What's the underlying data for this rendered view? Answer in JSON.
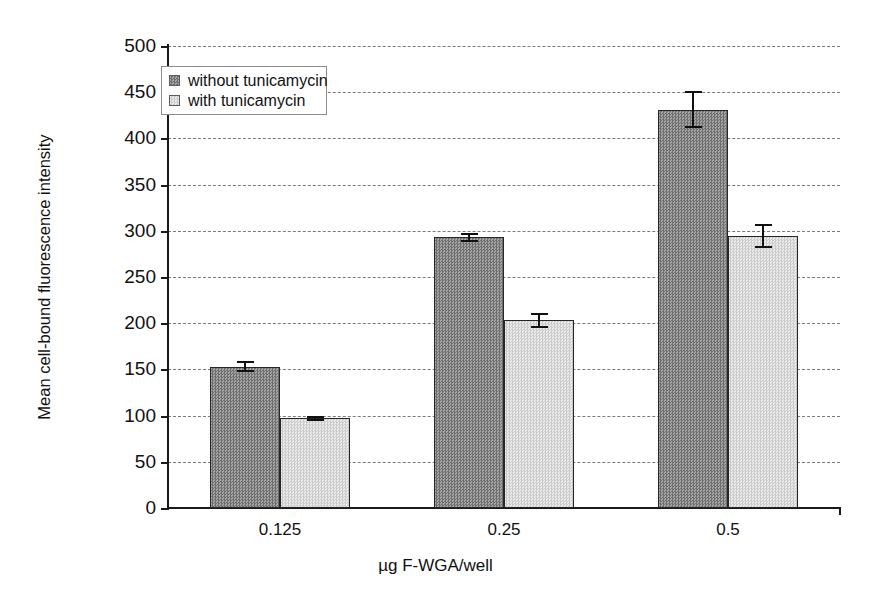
{
  "chart_data": {
    "type": "bar",
    "title": "",
    "xlabel": "µg F-WGA/well",
    "ylabel": "Mean cell-bound fluorescence intensity",
    "categories": [
      "0.125",
      "0.25",
      "0.5"
    ],
    "ylim": [
      0,
      500
    ],
    "ytick_labels": [
      "0",
      "50",
      "100",
      "150",
      "200",
      "250",
      "300",
      "350",
      "400",
      "450",
      "500"
    ],
    "ytick_values": [
      0,
      50,
      100,
      150,
      200,
      250,
      300,
      350,
      400,
      450,
      500
    ],
    "grid": "horizontal-dashed",
    "legend_position": "upper-left-inside",
    "series": [
      {
        "name": "without tunicamycin",
        "swatch": "dark",
        "color": "#8e8e8e",
        "values": [
          153,
          293,
          431
        ],
        "errors": [
          6,
          5,
          20
        ]
      },
      {
        "name": "with tunicamycin",
        "swatch": "light",
        "color": "#d8d8d8",
        "values": [
          97,
          203,
          294
        ],
        "errors": [
          3,
          8,
          13
        ]
      }
    ]
  },
  "legend": {
    "items": [
      {
        "label": "without tunicamycin",
        "swatch": "dark"
      },
      {
        "label": "with tunicamycin",
        "swatch": "light"
      }
    ]
  },
  "axes": {
    "y_title": "Mean cell-bound fluorescence intensity",
    "x_title": "µg F-WGA/well"
  }
}
